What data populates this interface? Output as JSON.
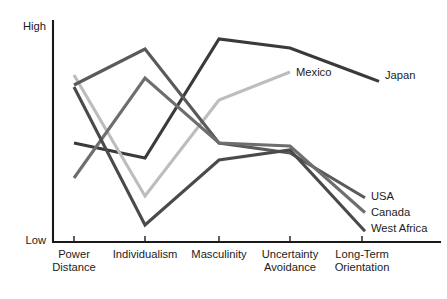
{
  "chart_data": {
    "type": "line",
    "title": "",
    "xlabel": "",
    "ylabel": "",
    "categories": [
      "Power Distance",
      "Individualism",
      "Masculinity",
      "Uncertainty Avoidance",
      "Long-Term Orientation"
    ],
    "category_lines": [
      [
        "Power",
        "Distance"
      ],
      [
        "Individualism"
      ],
      [
        "Masculinity"
      ],
      [
        "Uncertainty",
        "Avoidance"
      ],
      [
        "Long-Term",
        "Orientation"
      ]
    ],
    "y_axis": {
      "low_label": "Low",
      "high_label": "High",
      "ylim": [
        0,
        100
      ],
      "grid": false,
      "ticks": [
        "Low",
        "High"
      ]
    },
    "legend_position": "inline-right-of-line-ends",
    "series": [
      {
        "name": "Japan",
        "color": "#3a3a3a",
        "values": [
          48,
          41,
          92,
          88,
          75
        ],
        "label_x": 385,
        "label_y": 79
      },
      {
        "name": "Mexico",
        "color": "#bdbdbd",
        "values": [
          79,
          21,
          65,
          80,
          null
        ],
        "label_x": 296,
        "label_y": 76
      },
      {
        "name": "USA",
        "color": "#5a5a5a",
        "values": [
          75,
          92,
          49,
          45,
          25
        ],
        "label_x": 371,
        "label_y": 200
      },
      {
        "name": "Canada",
        "color": "#6e6e6e",
        "values": [
          32,
          79,
          49,
          48,
          18
        ],
        "label_x": 371,
        "label_y": 216
      },
      {
        "name": "West Africa",
        "color": "#4a4a4a",
        "values": [
          74,
          6,
          41,
          46,
          8
        ],
        "label_x": 371,
        "label_y": 232
      }
    ],
    "pixel_geometry": {
      "x_positions": [
        74,
        145,
        219,
        290,
        362
      ],
      "plot_top": 26,
      "plot_bottom": 242,
      "axis_x": 53,
      "series_pixel_y": {
        "Japan": [
          143,
          158,
          39,
          48,
          75
        ],
        "Mexico": [
          75,
          196,
          100,
          72,
          null
        ],
        "USA": [
          85,
          49,
          143,
          153,
          196
        ],
        "Canada": [
          178,
          78,
          143,
          146,
          210
        ],
        "West Africa": [
          87,
          225,
          160,
          150,
          228
        ]
      }
    }
  }
}
